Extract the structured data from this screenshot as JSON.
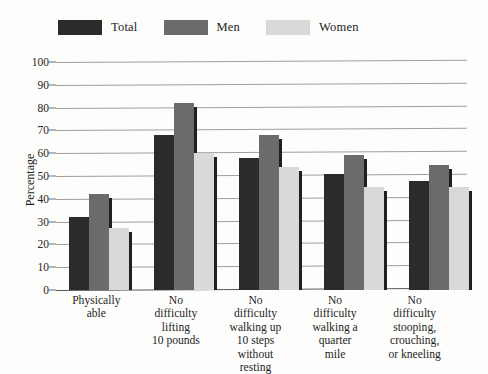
{
  "chart_data": {
    "type": "bar",
    "title": "",
    "subtitle": "",
    "xlabel": "",
    "ylabel": "Percentage",
    "ylim": [
      0,
      100
    ],
    "ytick_step": 10,
    "yticks": [
      100,
      90,
      80,
      70,
      60,
      50,
      40,
      30,
      20,
      10,
      0
    ],
    "grid": true,
    "legend_position": "top-left",
    "categories": [
      "Physically able",
      "No difficulty lifting 10 pounds",
      "No difficulty walking up 10 steps without resting",
      "No difficulty walking a quarter mile",
      "No difficulty stooping, crouching, or kneeling"
    ],
    "category_lines": [
      [
        "Physically",
        "able"
      ],
      [
        "No difficulty",
        "lifting",
        "10 pounds"
      ],
      [
        "No difficulty",
        "walking up",
        "10 steps",
        "without resting"
      ],
      [
        "No difficulty",
        "walking a",
        "quarter mile"
      ],
      [
        "No difficulty",
        "stooping,",
        "crouching,",
        "or kneeling"
      ]
    ],
    "series": [
      {
        "name": "Total",
        "color": "#2b2b2b",
        "values": [
          32,
          68,
          58,
          51,
          48
        ]
      },
      {
        "name": "Men",
        "color": "#6b6b6b",
        "values": [
          42,
          82,
          68,
          59,
          55
        ]
      },
      {
        "name": "Women",
        "color": "#d9d9d9",
        "values": [
          27,
          60,
          54,
          45,
          45
        ]
      }
    ]
  },
  "legend": {
    "entries": [
      {
        "label": "Total",
        "color": "#2b2b2b"
      },
      {
        "label": "Men",
        "color": "#6b6b6b"
      },
      {
        "label": "Women",
        "color": "#d9d9d9"
      }
    ]
  },
  "axis": {
    "y_title": "Percentage"
  }
}
